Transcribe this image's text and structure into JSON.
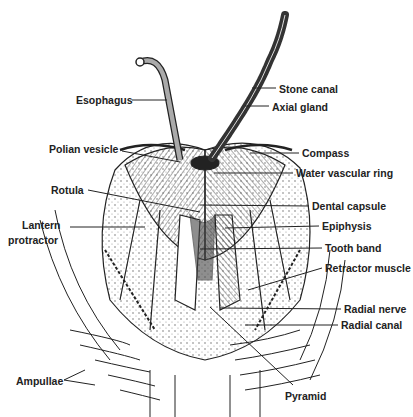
{
  "figure": {
    "labels_left": [
      {
        "text": "Esophagus",
        "x": 76,
        "y": 94
      },
      {
        "text": "Polian vesicle",
        "x": 49,
        "y": 143
      },
      {
        "text": "Rotula",
        "x": 51,
        "y": 184
      },
      {
        "text": "Lantern",
        "x": 22,
        "y": 219
      },
      {
        "text": "protractor",
        "x": 8,
        "y": 234
      },
      {
        "text": "Ampullae",
        "x": 16,
        "y": 375
      }
    ],
    "labels_right": [
      {
        "text": "Stone canal",
        "x": 279,
        "y": 83
      },
      {
        "text": "Axial gland",
        "x": 272,
        "y": 101
      },
      {
        "text": "Compass",
        "x": 302,
        "y": 146
      },
      {
        "text": "Water vascular ring",
        "x": 296,
        "y": 167
      },
      {
        "text": "Dental capsule",
        "x": 312,
        "y": 200
      },
      {
        "text": "Epiphysis",
        "x": 322,
        "y": 220
      },
      {
        "text": "Tooth band",
        "x": 325,
        "y": 242
      },
      {
        "text": "Retractor muscle",
        "x": 325,
        "y": 262
      },
      {
        "text": "Radial nerve",
        "x": 344,
        "y": 303
      },
      {
        "text": "Radial canal",
        "x": 341,
        "y": 319
      },
      {
        "text": "Pyramid",
        "x": 285,
        "y": 390
      }
    ]
  }
}
